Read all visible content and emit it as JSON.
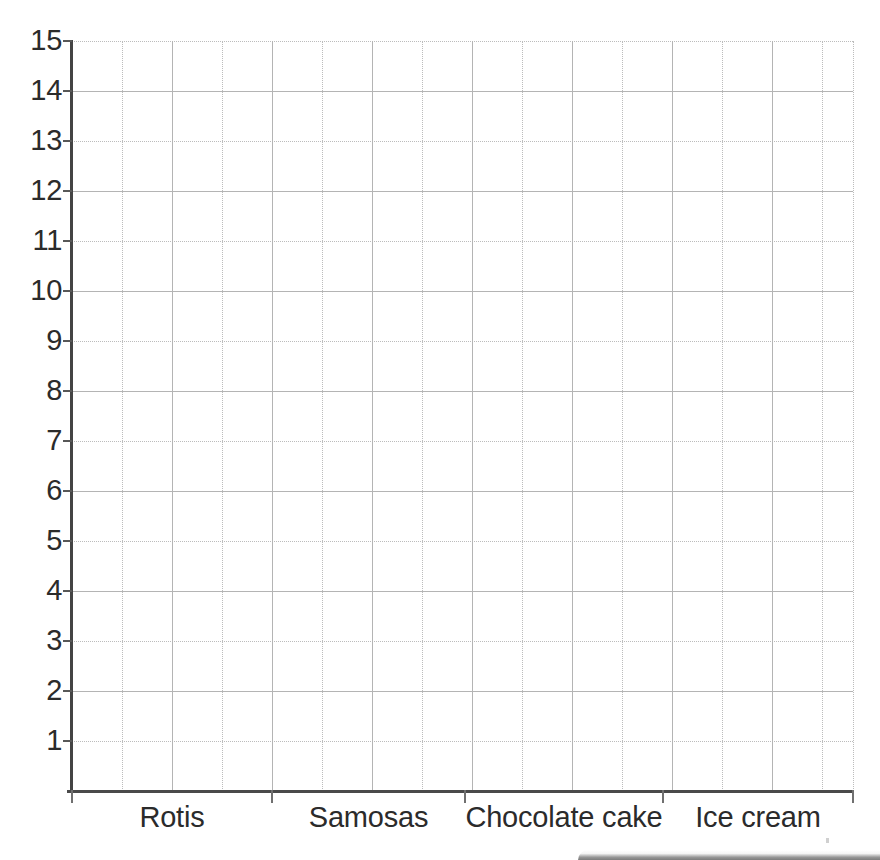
{
  "chart_data": {
    "type": "bar",
    "title": "",
    "subtitle": "",
    "xlabel": "",
    "ylabel": "",
    "categories": [
      "Rotis",
      "Samosas",
      "Chocolate cake",
      "Ice cream"
    ],
    "values": [
      null,
      null,
      null,
      null
    ],
    "series": [
      {
        "name": "",
        "values": [
          null,
          null,
          null,
          null
        ]
      }
    ],
    "ylim": [
      0,
      15
    ],
    "y_tick_labels": [
      "15",
      "14",
      "13",
      "12",
      "11",
      "10",
      "9",
      "8",
      "7",
      "6",
      "5",
      "4",
      "3",
      "2",
      "1"
    ],
    "y_tick_values": [
      15,
      14,
      13,
      12,
      11,
      10,
      9,
      8,
      7,
      6,
      5,
      4,
      3,
      2,
      1
    ],
    "y_tick_step": 1,
    "grid": true,
    "grid_style": "alternating solid and dotted square grid",
    "legend": null,
    "legend_position": "none",
    "annotations": [],
    "note": "Empty grid template - no bars plotted"
  },
  "axes": {
    "axis_color": "#4a4a4a",
    "gridline_color": "#b4b4b4",
    "gridline_dotted_color": "#bcbcbc",
    "label_color": "#2b2b2b",
    "background": "#ffffff"
  },
  "artifacts": {
    "scan_shadow": "page-edge-shadow"
  }
}
